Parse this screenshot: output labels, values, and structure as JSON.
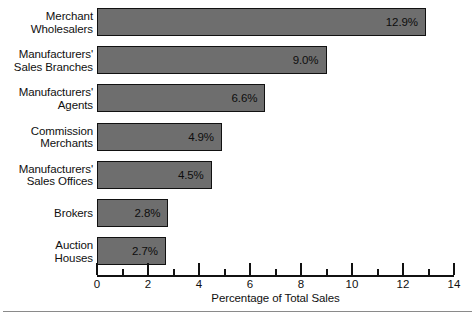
{
  "chart_data": {
    "type": "bar",
    "orientation": "horizontal",
    "title": "",
    "xlabel": "Percentage of Total Sales",
    "ylabel": "",
    "xlim": [
      0,
      14
    ],
    "grid": false,
    "legend": false,
    "major_ticks": [
      0,
      2,
      4,
      6,
      8,
      10,
      12,
      14
    ],
    "minor_ticks": [
      1,
      3,
      5,
      7,
      9,
      11,
      13
    ],
    "tick_labels": [
      "0",
      "2",
      "4",
      "6",
      "8",
      "10",
      "12",
      "14"
    ],
    "categories": [
      "Merchant\nWholesalers",
      "Manufacturers'\nSales Branches",
      "Manufacturers'\nAgents",
      "Commission\nMerchants",
      "Manufacturers'\nSales Offices",
      "Brokers",
      "Auction\nHouses"
    ],
    "values": [
      12.9,
      9.0,
      6.6,
      4.9,
      4.5,
      2.8,
      2.7
    ],
    "value_labels": [
      "12.9%",
      "9.0%",
      "6.6%",
      "4.9%",
      "4.5%",
      "2.8%",
      "2.7%"
    ],
    "bar_color": "#6e6e6e",
    "bar_border_color": "#111111",
    "background_color": "#ffffff"
  }
}
